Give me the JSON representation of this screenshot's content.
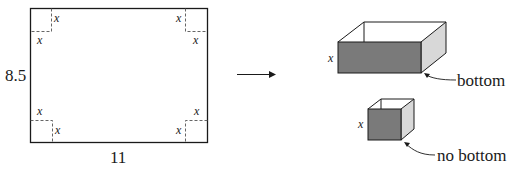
{
  "sheet": {
    "height_label": "8.5",
    "width_label": "11",
    "corner_cut_label": "x",
    "corners": [
      {
        "position": "top-left",
        "labels": [
          "x",
          "x"
        ]
      },
      {
        "position": "top-right",
        "labels": [
          "x",
          "x"
        ]
      },
      {
        "position": "bottom-left",
        "labels": [
          "x",
          "x"
        ]
      },
      {
        "position": "bottom-right",
        "labels": [
          "x",
          "x"
        ]
      }
    ]
  },
  "arrow": {
    "direction": "right"
  },
  "boxes": [
    {
      "name": "open-box-with-bottom",
      "height_label": "x",
      "callout": "bottom"
    },
    {
      "name": "tube-no-bottom",
      "height_label": "x",
      "callout": "no bottom"
    }
  ],
  "colors": {
    "stroke": "#1a1a1a",
    "dashed": "#555555",
    "front_face": "#7a7a7a",
    "side_face": "#d8d8d8"
  }
}
